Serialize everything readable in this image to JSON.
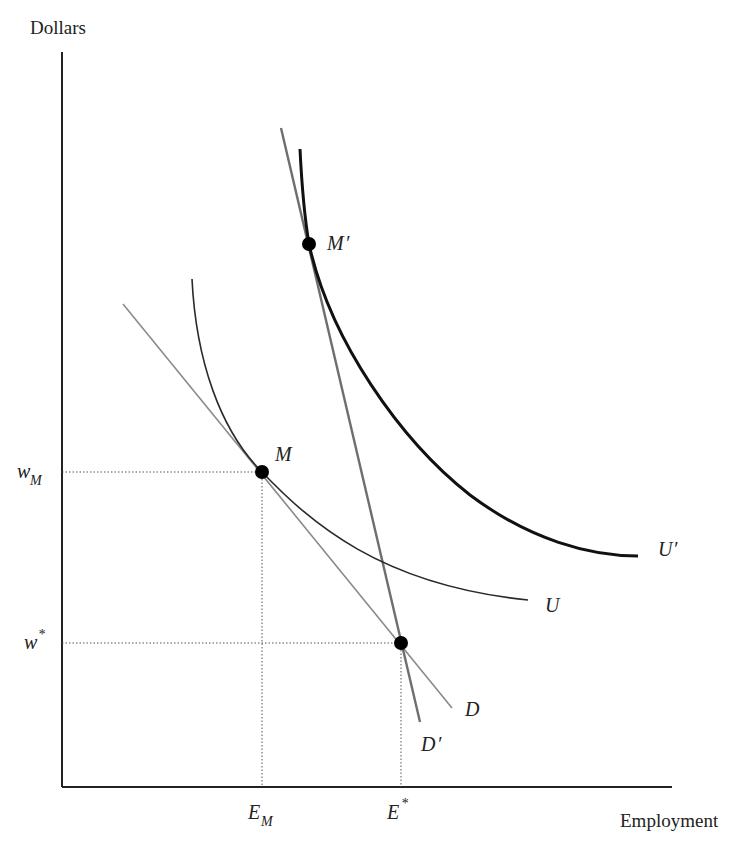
{
  "diagram": {
    "y_axis_label": "Dollars",
    "x_axis_label": "Employment",
    "y_ticks": [
      {
        "base": "w",
        "sub": "M",
        "sup": ""
      },
      {
        "base": "w",
        "sub": "",
        "sup": "*"
      }
    ],
    "x_ticks": [
      {
        "base": "E",
        "sub": "M",
        "sup": ""
      },
      {
        "base": "E",
        "sub": "",
        "sup": "*"
      }
    ],
    "points": [
      {
        "label": "M",
        "prime": ""
      },
      {
        "label": "M",
        "prime": "′"
      },
      {
        "label": "",
        "prime": ""
      }
    ],
    "curves": [
      {
        "label": "U",
        "prime": "",
        "kind": "isoprofit / indifference curve"
      },
      {
        "label": "U",
        "prime": "′",
        "kind": "higher indifference curve"
      },
      {
        "label": "D",
        "prime": "",
        "kind": "demand curve"
      },
      {
        "label": "D",
        "prime": "′",
        "kind": "steeper demand curve"
      }
    ],
    "colors": {
      "axis": "#222222",
      "curve_U": "#2a2a2a",
      "curve_U_prime": "#111111",
      "demand_D": "#8a8a8a",
      "demand_D_prime": "#6e6e6e",
      "guide_lines": "#555555",
      "points": "#000000"
    }
  }
}
